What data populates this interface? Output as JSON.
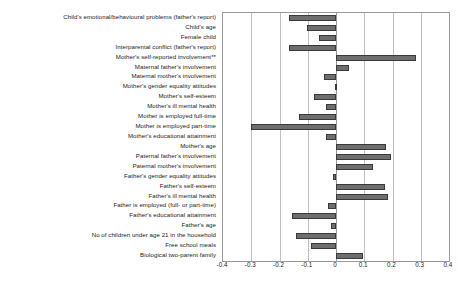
{
  "chart_data": {
    "type": "bar",
    "orientation": "horizontal",
    "title": "",
    "subtitle": "",
    "xlabel": "",
    "ylabel": "",
    "xlim": [
      -0.4,
      0.4
    ],
    "grid": true,
    "legend": false,
    "xticks": [
      "-0.4",
      "-0.3",
      "-0.2",
      "-0.1",
      "0",
      "0.1",
      "0.2",
      "0.3",
      "0.4"
    ],
    "xtick_values": [
      -0.4,
      -0.3,
      -0.2,
      -0.1,
      0,
      0.1,
      0.2,
      0.3,
      0.4
    ],
    "categories": [
      "Child's emotional/behavioural problems (father's report)",
      "Child's age",
      "Female child",
      "Interparental conflict (father's report)",
      "Mother's self-reported involvement**",
      "Maternal father's involvement",
      "Maternal mother's involvement",
      "Mother's gender equality attitudes",
      "Mother's self-esteem",
      "Mother's ill mental health",
      "Mother is employed full-time",
      "Mother is employed part-time",
      "Mother's educational attainment",
      "Mother's age",
      "Paternal father's involvement",
      "Paternal mother's involvement",
      "Father's gender equality attitudes",
      "Father's self-esteem",
      "Father's ill mental health",
      "Father is employed (full- or part-time)",
      "Father's educational attainment",
      "Father's age",
      "No of children under age 21 in the household",
      "Free school meals",
      "Biological two-parent family"
    ],
    "values": [
      -0.166,
      -0.103,
      -0.06,
      -0.166,
      0.283,
      0.046,
      -0.042,
      -0.005,
      -0.078,
      -0.035,
      -0.13,
      -0.3,
      -0.035,
      0.177,
      0.195,
      0.13,
      -0.01,
      0.175,
      0.183,
      -0.028,
      -0.155,
      -0.018,
      -0.14,
      -0.09,
      0.097
    ],
    "bar_color": "#6e6e6e",
    "bar_edge_color": "#3a3a3a",
    "gridline_color": "#bfbfbf",
    "axis_color": "#9a9a9a"
  }
}
